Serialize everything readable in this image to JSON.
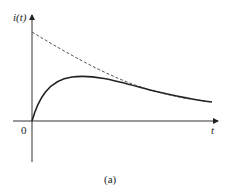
{
  "figure": {
    "y_axis_label": "i(t)",
    "x_axis_label": "t",
    "origin_label": "0",
    "caption": "(a)"
  },
  "colors": {
    "axis": "#333333",
    "solid_curve": "#222222",
    "dashed_curve": "#555555"
  },
  "curves": [
    {
      "name": "response",
      "style": "solid",
      "description": "rises from 0, peaks, then decays toward the dashed envelope"
    },
    {
      "name": "envelope",
      "style": "dashed",
      "description": "exponential decay starting high on the i(t) axis"
    }
  ]
}
